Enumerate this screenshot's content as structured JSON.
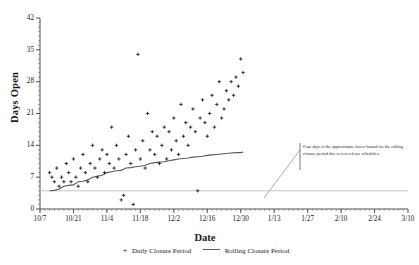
{
  "chart_data": {
    "type": "scatter",
    "title": "",
    "xlabel": "Date",
    "ylabel": "Days Open",
    "grid": false,
    "legend_position": "bottom",
    "ylim": [
      0,
      42
    ],
    "yticks": [
      0,
      7,
      14,
      21,
      28,
      35,
      42
    ],
    "xticks": [
      "10/7",
      "10/21",
      "11/4",
      "11/18",
      "12/2",
      "12/16",
      "12/30",
      "1/13",
      "1/27",
      "2/10",
      "2/24",
      "3/10"
    ],
    "xlim_days": [
      0,
      154
    ],
    "reference_line": {
      "value": 4,
      "label": "four-day lower bound",
      "color": "#b9b9b9"
    },
    "annotation": {
      "text": "Four days is the approximate lower-bound for the rolling closure period due to test release schedules.",
      "border_color": "#555555"
    },
    "series": [
      {
        "name": "Daily Closure Period",
        "type": "scatter",
        "marker": "+",
        "color": "#1a1a1a",
        "points": [
          [
            4,
            8
          ],
          [
            5,
            7
          ],
          [
            6,
            6
          ],
          [
            7,
            9
          ],
          [
            8,
            5
          ],
          [
            9,
            7
          ],
          [
            10,
            6
          ],
          [
            11,
            10
          ],
          [
            12,
            8
          ],
          [
            13,
            6
          ],
          [
            14,
            11
          ],
          [
            15,
            7
          ],
          [
            16,
            5
          ],
          [
            17,
            9
          ],
          [
            18,
            12
          ],
          [
            19,
            8
          ],
          [
            20,
            6
          ],
          [
            21,
            10
          ],
          [
            22,
            14
          ],
          [
            23,
            9
          ],
          [
            24,
            7
          ],
          [
            25,
            11
          ],
          [
            26,
            13
          ],
          [
            27,
            8
          ],
          [
            28,
            12
          ],
          [
            29,
            10
          ],
          [
            30,
            18
          ],
          [
            31,
            9
          ],
          [
            32,
            14
          ],
          [
            33,
            11
          ],
          [
            34,
            2
          ],
          [
            35,
            3
          ],
          [
            36,
            12
          ],
          [
            37,
            16
          ],
          [
            38,
            10
          ],
          [
            39,
            1
          ],
          [
            40,
            13
          ],
          [
            41,
            34
          ],
          [
            42,
            11
          ],
          [
            43,
            15
          ],
          [
            44,
            9
          ],
          [
            45,
            21
          ],
          [
            46,
            13
          ],
          [
            47,
            17
          ],
          [
            48,
            12
          ],
          [
            49,
            16
          ],
          [
            50,
            10
          ],
          [
            51,
            14
          ],
          [
            52,
            18
          ],
          [
            53,
            11
          ],
          [
            54,
            17
          ],
          [
            55,
            13
          ],
          [
            56,
            20
          ],
          [
            57,
            15
          ],
          [
            58,
            12
          ],
          [
            59,
            23
          ],
          [
            60,
            16
          ],
          [
            61,
            19
          ],
          [
            62,
            14
          ],
          [
            63,
            18
          ],
          [
            64,
            22
          ],
          [
            65,
            17
          ],
          [
            66,
            4
          ],
          [
            67,
            20
          ],
          [
            68,
            24
          ],
          [
            69,
            19
          ],
          [
            70,
            16
          ],
          [
            71,
            21
          ],
          [
            72,
            25
          ],
          [
            73,
            18
          ],
          [
            74,
            23
          ],
          [
            75,
            28
          ],
          [
            76,
            20
          ],
          [
            77,
            22
          ],
          [
            78,
            26
          ],
          [
            79,
            24
          ],
          [
            80,
            28
          ],
          [
            81,
            25
          ],
          [
            82,
            29
          ],
          [
            83,
            27
          ],
          [
            84,
            33
          ],
          [
            85,
            30
          ]
        ]
      },
      {
        "name": "Rolling Closure Period",
        "type": "line",
        "color": "#5a5a5a",
        "points": [
          [
            4,
            4.0
          ],
          [
            6,
            4.1
          ],
          [
            8,
            4.4
          ],
          [
            10,
            5.0
          ],
          [
            12,
            5.2
          ],
          [
            14,
            5.3
          ],
          [
            16,
            6.0
          ],
          [
            18,
            6.1
          ],
          [
            20,
            6.4
          ],
          [
            22,
            7.0
          ],
          [
            24,
            7.2
          ],
          [
            26,
            7.4
          ],
          [
            28,
            8.0
          ],
          [
            30,
            8.2
          ],
          [
            32,
            8.4
          ],
          [
            34,
            8.5
          ],
          [
            36,
            9.0
          ],
          [
            38,
            9.1
          ],
          [
            40,
            9.3
          ],
          [
            42,
            9.4
          ],
          [
            44,
            9.6
          ],
          [
            46,
            10.0
          ],
          [
            48,
            10.2
          ],
          [
            50,
            10.3
          ],
          [
            52,
            10.4
          ],
          [
            54,
            10.6
          ],
          [
            56,
            10.8
          ],
          [
            58,
            11.0
          ],
          [
            60,
            11.1
          ],
          [
            62,
            11.2
          ],
          [
            64,
            11.4
          ],
          [
            66,
            11.5
          ],
          [
            68,
            11.6
          ],
          [
            70,
            11.8
          ],
          [
            72,
            11.9
          ],
          [
            74,
            12.0
          ],
          [
            76,
            12.1
          ],
          [
            78,
            12.2
          ],
          [
            80,
            12.3
          ],
          [
            82,
            12.4
          ],
          [
            84,
            12.4
          ],
          [
            85,
            12.5
          ]
        ]
      }
    ]
  },
  "legend": {
    "items": [
      {
        "marker": "+",
        "label": "Daily Closure Period"
      },
      {
        "marker": "line",
        "label": "Rolling Closure Period"
      }
    ]
  }
}
